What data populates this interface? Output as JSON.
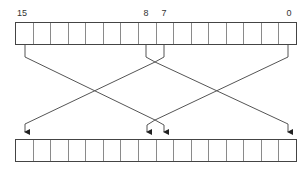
{
  "diagram": {
    "bit_labels": [
      {
        "text": "15",
        "x": 22,
        "y": 9
      },
      {
        "text": "8",
        "x": 146,
        "y": 9
      },
      {
        "text": "7",
        "x": 164,
        "y": 9
      },
      {
        "text": "0",
        "x": 289,
        "y": 9
      }
    ],
    "registers": {
      "source": {
        "cells": 16,
        "top": 22
      },
      "destination": {
        "cells": 16,
        "top": 139
      }
    },
    "mappings": [
      {
        "from": "high-byte",
        "from_bits": "15-8",
        "to": "low-byte",
        "to_bits": "7-0"
      },
      {
        "from": "low-byte",
        "from_bits": "7-0",
        "to": "high-byte",
        "to_bits": "15-8"
      }
    ],
    "colors": {
      "line": "#555555",
      "register_border": "#444444",
      "cell_divider": "#8a8a8a",
      "label": "#333333"
    }
  }
}
